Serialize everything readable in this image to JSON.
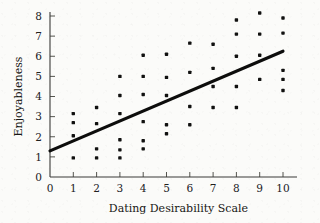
{
  "chart_data": {
    "type": "scatter",
    "title": "",
    "xlabel": "Dating Desirability Scale",
    "ylabel": "Enjoyableness",
    "xlim": [
      0,
      10.6
    ],
    "ylim": [
      0,
      8.4
    ],
    "xticks": [
      0,
      1,
      2,
      3,
      4,
      5,
      6,
      7,
      8,
      9,
      10
    ],
    "yticks": [
      0,
      1,
      2,
      3,
      4,
      5,
      6,
      7,
      8
    ],
    "xtick_labels": [
      "0",
      "1",
      "2",
      "3",
      "4",
      "5",
      "6",
      "7",
      "8",
      "9",
      "10"
    ],
    "ytick_labels": [
      "0",
      "1",
      "2",
      "3",
      "4",
      "5",
      "6",
      "7",
      "8"
    ],
    "grid": false,
    "legend": false,
    "marker": "square-dot",
    "marker_color": "#111110",
    "points": [
      {
        "x": 1,
        "y": 3.15
      },
      {
        "x": 1,
        "y": 2.7
      },
      {
        "x": 1,
        "y": 2.05
      },
      {
        "x": 1,
        "y": 0.95
      },
      {
        "x": 2,
        "y": 3.45
      },
      {
        "x": 2,
        "y": 2.65
      },
      {
        "x": 2,
        "y": 1.4
      },
      {
        "x": 2,
        "y": 0.95
      },
      {
        "x": 3,
        "y": 5.0
      },
      {
        "x": 3,
        "y": 4.05
      },
      {
        "x": 3,
        "y": 3.15
      },
      {
        "x": 3,
        "y": 1.85
      },
      {
        "x": 3,
        "y": 1.35
      },
      {
        "x": 3,
        "y": 0.95
      },
      {
        "x": 4,
        "y": 6.05
      },
      {
        "x": 4,
        "y": 5.0
      },
      {
        "x": 4,
        "y": 4.1
      },
      {
        "x": 4,
        "y": 2.75
      },
      {
        "x": 4,
        "y": 1.8
      },
      {
        "x": 4,
        "y": 1.4
      },
      {
        "x": 5,
        "y": 6.1
      },
      {
        "x": 5,
        "y": 4.95
      },
      {
        "x": 5,
        "y": 4.05
      },
      {
        "x": 5,
        "y": 2.6
      },
      {
        "x": 5,
        "y": 2.15
      },
      {
        "x": 6,
        "y": 6.65
      },
      {
        "x": 6,
        "y": 5.2
      },
      {
        "x": 6,
        "y": 3.5
      },
      {
        "x": 6,
        "y": 2.6
      },
      {
        "x": 7,
        "y": 6.6
      },
      {
        "x": 7,
        "y": 5.4
      },
      {
        "x": 7,
        "y": 4.5
      },
      {
        "x": 7,
        "y": 3.45
      },
      {
        "x": 8,
        "y": 7.8
      },
      {
        "x": 8,
        "y": 7.1
      },
      {
        "x": 8,
        "y": 6.0
      },
      {
        "x": 8,
        "y": 4.5
      },
      {
        "x": 8,
        "y": 3.45
      },
      {
        "x": 9,
        "y": 8.15
      },
      {
        "x": 9,
        "y": 7.1
      },
      {
        "x": 9,
        "y": 6.05
      },
      {
        "x": 9,
        "y": 4.85
      },
      {
        "x": 10,
        "y": 7.9
      },
      {
        "x": 10,
        "y": 7.15
      },
      {
        "x": 10,
        "y": 5.3
      },
      {
        "x": 10,
        "y": 4.85
      },
      {
        "x": 10,
        "y": 4.3
      }
    ],
    "trend_line": {
      "x_start": 0,
      "y_start": 1.3,
      "x_end": 10,
      "y_end": 6.25
    }
  }
}
